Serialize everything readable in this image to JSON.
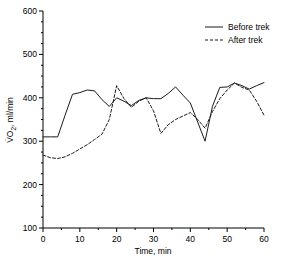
{
  "chart_data": {
    "type": "line",
    "title": "",
    "xlabel": "Time, min",
    "ylabel": "V̇O2, ml/min",
    "ylabel_parts": {
      "lead": "V̇O",
      "sub": "2",
      "tail": ", ml/min"
    },
    "xlim": [
      0,
      60
    ],
    "ylim": [
      100,
      600
    ],
    "xticks": [
      0,
      10,
      20,
      30,
      40,
      50,
      60
    ],
    "yticks": [
      100,
      200,
      300,
      400,
      500,
      600
    ],
    "xtick_labels": [
      "0",
      "10",
      "20",
      "30",
      "40",
      "50",
      "60"
    ],
    "ytick_labels": [
      "100",
      "200",
      "300",
      "400",
      "500",
      "600"
    ],
    "x_minor_step": 5,
    "y_minor_step": 25,
    "grid": false,
    "legend_position": "top-right",
    "series": [
      {
        "name": "Before trek",
        "style": "solid",
        "color": "#1a1a1a",
        "x": [
          0,
          2,
          4,
          6,
          8,
          10,
          12,
          14,
          16,
          18,
          20,
          22,
          24,
          26,
          28,
          30,
          32,
          34,
          36,
          38,
          40,
          42,
          44,
          46,
          48,
          50,
          52,
          54,
          56,
          58,
          60
        ],
        "values": [
          310,
          310,
          310,
          360,
          408,
          412,
          418,
          416,
          396,
          380,
          400,
          392,
          382,
          394,
          400,
          398,
          398,
          410,
          425,
          406,
          388,
          344,
          300,
          380,
          424,
          425,
          434,
          428,
          420,
          428,
          435
        ]
      },
      {
        "name": "After trek",
        "style": "dashed",
        "color": "#1a1a1a",
        "x": [
          0,
          2,
          4,
          6,
          8,
          10,
          12,
          14,
          16,
          18,
          20,
          22,
          24,
          26,
          28,
          30,
          32,
          34,
          36,
          38,
          40,
          42,
          44,
          46,
          48,
          50,
          52,
          54,
          56,
          58,
          60
        ],
        "values": [
          268,
          262,
          260,
          264,
          272,
          282,
          292,
          304,
          316,
          350,
          428,
          398,
          378,
          392,
          400,
          370,
          318,
          338,
          350,
          358,
          366,
          350,
          330,
          368,
          398,
          418,
          434,
          424,
          418,
          392,
          360
        ]
      }
    ]
  },
  "legend": {
    "entries": [
      {
        "label": "Before trek",
        "style": "solid"
      },
      {
        "label": "After trek",
        "style": "dashed"
      }
    ]
  }
}
